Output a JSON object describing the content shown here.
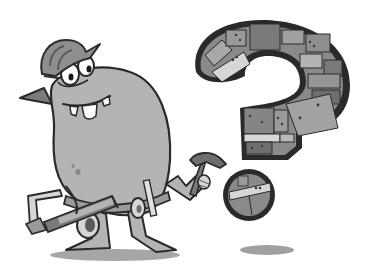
{
  "illustration": {
    "caption": "Cartoon monster construction worker with tools beside a brick question mark",
    "style": "grayscale cartoon",
    "colors": {
      "background": "#ffffff",
      "outline": "#2a2a2a",
      "body": "#b4b4b4",
      "body_shadow": "#9c9c9c",
      "hat": "#8e8e8e",
      "brick_dark": "#6e6e6e",
      "brick_mid": "#8a8a8a",
      "brick_light": "#a8a8a8",
      "brick_pale": "#d6d6d6",
      "tool_gray": "#7a7a7a",
      "ground_shadow": "#a0a0a0",
      "eye_white": "#ffffff",
      "teeth": "#ffffff"
    },
    "elements": {
      "character": "monster",
      "headwear": "hard-hat",
      "tools": [
        "hammer",
        "hacksaw",
        "ruler",
        "tool-belt"
      ],
      "symbol": "question-mark"
    }
  }
}
